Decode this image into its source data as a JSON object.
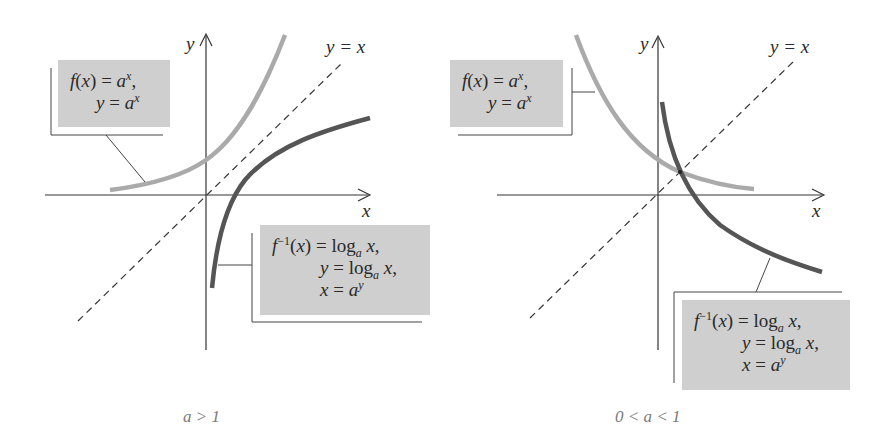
{
  "figure": {
    "panels": [
      {
        "id": "a-greater-than-1",
        "caption": "a > 1",
        "axis_labels": {
          "x": "x",
          "y": "y"
        },
        "diagonal_label": "y = x",
        "exp_label": {
          "line1": "f(x) = a^x,",
          "line2": "y = a^x"
        },
        "log_label": {
          "line1": "f^{-1}(x) = log_a x,",
          "line2": "y = log_a x,",
          "line3": "x = a^y"
        }
      },
      {
        "id": "a-between-0-and-1",
        "caption": "0 < a < 1",
        "axis_labels": {
          "x": "x",
          "y": "y"
        },
        "diagonal_label": "y = x",
        "exp_label": {
          "line1": "f(x) = a^x,",
          "line2": "y = a^x"
        },
        "log_label": {
          "line1": "f^{-1}(x) = log_a x,",
          "line2": "y = log_a x,",
          "line3": "x = a^y"
        }
      }
    ],
    "text": {
      "x": "x",
      "y": "y",
      "eq": "=",
      "f": "f",
      "a": "a",
      "log": "log",
      "inv": "−1",
      "diag": "y = x",
      "cap_left": "a > 1",
      "cap_right": "0 < a < 1",
      "fx_open": "(",
      "fx_close": ")",
      "comma": ","
    },
    "colors": {
      "exp_curve": "#aaaaaa",
      "log_curve": "#555555",
      "axis": "#333333",
      "label_fill": "#cfcfcf",
      "caption": "#7a7a7a"
    }
  }
}
